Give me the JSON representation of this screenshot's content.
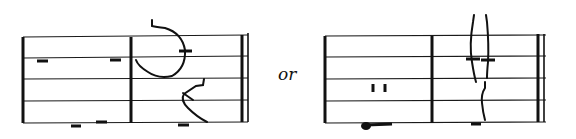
{
  "figure": {
    "separator_label": "or",
    "systems": [
      {
        "name": "example-a",
        "staff_lines": 5,
        "measures": 2,
        "ending": "final-double-barline"
      },
      {
        "name": "example-b",
        "staff_lines": 5,
        "measures": 2,
        "ending": "final-double-barline"
      }
    ]
  }
}
